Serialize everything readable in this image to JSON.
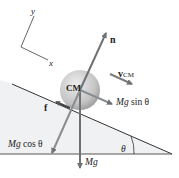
{
  "axes": {
    "x_label": "x",
    "y_label": "y"
  },
  "labels": {
    "normal": "n",
    "velocity": "v",
    "velocity_sub": "CM",
    "center": "CM",
    "friction": "f",
    "parallel_mg": "Mg",
    "parallel_fn": " sin θ",
    "perp_mg": "Mg",
    "perp_fn": " cos θ",
    "weight": "Mg",
    "angle": "θ"
  },
  "colors": {
    "incline_fill": "#f0f1f2",
    "line": "#333333",
    "arrow": "#7a7d80",
    "sphere_light": "#e6e6e6",
    "sphere_dark": "#9a9a9a"
  }
}
